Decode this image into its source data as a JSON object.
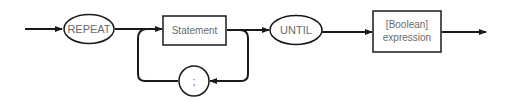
{
  "diagram": {
    "type": "syntax-diagram",
    "nodes": {
      "repeat": {
        "label": "REPEAT",
        "shape": "ellipse"
      },
      "statement": {
        "label": "Statement",
        "shape": "box"
      },
      "separator": {
        "label": ";",
        "shape": "circle"
      },
      "until": {
        "label": "UNTIL",
        "shape": "ellipse"
      },
      "boolean": {
        "line1": "[Boolean]",
        "line2": "expression",
        "shape": "box"
      }
    },
    "edges": [
      {
        "from": "entry",
        "to": "repeat"
      },
      {
        "from": "repeat",
        "to": "statement"
      },
      {
        "from": "statement",
        "to": "until"
      },
      {
        "from": "statement",
        "to": "separator",
        "note": "loop back"
      },
      {
        "from": "separator",
        "to": "statement",
        "note": "loop back"
      },
      {
        "from": "until",
        "to": "boolean"
      },
      {
        "from": "boolean",
        "to": "exit"
      }
    ],
    "colors": {
      "line": "#1a1a1a",
      "text": "#6a6a6a",
      "background": "#ffffff"
    }
  }
}
